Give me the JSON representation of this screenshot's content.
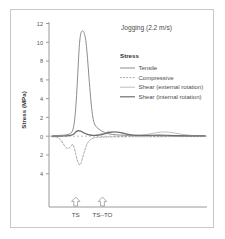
{
  "chart_data": {
    "type": "line",
    "title": "Jogging (2.2 m/s)",
    "xlabel": "",
    "ylabel": "Stress (MPa)",
    "ylim": [
      -4,
      12
    ],
    "y_ticks": [
      12,
      10,
      8,
      6,
      4,
      2,
      0,
      2,
      4
    ],
    "y_tick_values": [
      12,
      10,
      8,
      6,
      4,
      2,
      0,
      -2,
      -4
    ],
    "grid": false,
    "zero_line": true,
    "legend_position": "upper-right",
    "x_event_labels": [
      "TS",
      "TS–TO"
    ],
    "x_event_positions": [
      0.155,
      0.33
    ],
    "series": [
      {
        "name": "Tensile",
        "color": "#8c8c8c",
        "style": "solid",
        "width": 1.0,
        "points": [
          [
            0.0,
            0.05
          ],
          [
            0.04,
            0.08
          ],
          [
            0.08,
            0.12
          ],
          [
            0.105,
            0.2
          ],
          [
            0.125,
            0.35
          ],
          [
            0.14,
            0.9
          ],
          [
            0.152,
            2.4
          ],
          [
            0.163,
            5.0
          ],
          [
            0.172,
            7.8
          ],
          [
            0.18,
            9.9
          ],
          [
            0.188,
            10.9
          ],
          [
            0.196,
            11.2
          ],
          [
            0.205,
            11.15
          ],
          [
            0.214,
            10.8
          ],
          [
            0.223,
            9.9
          ],
          [
            0.232,
            8.3
          ],
          [
            0.242,
            6.2
          ],
          [
            0.252,
            4.2
          ],
          [
            0.262,
            2.6
          ],
          [
            0.272,
            1.6
          ],
          [
            0.285,
            1.1
          ],
          [
            0.3,
            0.85
          ],
          [
            0.32,
            0.6
          ],
          [
            0.345,
            0.4
          ],
          [
            0.375,
            0.25
          ],
          [
            0.42,
            0.15
          ],
          [
            0.48,
            0.1
          ],
          [
            0.56,
            0.08
          ],
          [
            0.66,
            0.06
          ],
          [
            0.78,
            0.05
          ],
          [
            0.9,
            0.04
          ],
          [
            1.0,
            0.04
          ]
        ]
      },
      {
        "name": "Compressive",
        "color": "#9a9a9a",
        "style": "dashed",
        "width": 0.9,
        "points": [
          [
            0.0,
            -0.05
          ],
          [
            0.03,
            -0.1
          ],
          [
            0.055,
            -0.35
          ],
          [
            0.075,
            -0.85
          ],
          [
            0.095,
            -1.25
          ],
          [
            0.112,
            -1.25
          ],
          [
            0.125,
            -1.0
          ],
          [
            0.136,
            -0.9
          ],
          [
            0.145,
            -1.2
          ],
          [
            0.155,
            -1.9
          ],
          [
            0.165,
            -2.55
          ],
          [
            0.175,
            -2.95
          ],
          [
            0.182,
            -3.05
          ],
          [
            0.19,
            -2.85
          ],
          [
            0.2,
            -2.3
          ],
          [
            0.212,
            -1.6
          ],
          [
            0.225,
            -1.0
          ],
          [
            0.24,
            -0.55
          ],
          [
            0.258,
            -0.28
          ],
          [
            0.28,
            -0.15
          ],
          [
            0.31,
            -0.1
          ],
          [
            0.35,
            -0.08
          ],
          [
            0.42,
            -0.06
          ],
          [
            0.5,
            -0.05
          ],
          [
            0.62,
            -0.05
          ],
          [
            0.78,
            -0.04
          ],
          [
            1.0,
            -0.04
          ]
        ]
      },
      {
        "name": "Shear (external rotation)",
        "color": "#b5b5b5",
        "style": "solid",
        "width": 0.9,
        "points": [
          [
            0.0,
            0.0
          ],
          [
            0.05,
            0.02
          ],
          [
            0.1,
            0.05
          ],
          [
            0.14,
            0.2
          ],
          [
            0.16,
            0.45
          ],
          [
            0.175,
            0.55
          ],
          [
            0.19,
            0.5
          ],
          [
            0.21,
            0.35
          ],
          [
            0.235,
            0.2
          ],
          [
            0.27,
            0.12
          ],
          [
            0.32,
            0.25
          ],
          [
            0.36,
            0.45
          ],
          [
            0.4,
            0.5
          ],
          [
            0.44,
            0.42
          ],
          [
            0.48,
            0.25
          ],
          [
            0.53,
            0.12
          ],
          [
            0.58,
            0.1
          ],
          [
            0.64,
            0.25
          ],
          [
            0.7,
            0.42
          ],
          [
            0.75,
            0.45
          ],
          [
            0.8,
            0.35
          ],
          [
            0.85,
            0.2
          ],
          [
            0.9,
            0.1
          ],
          [
            0.95,
            0.05
          ],
          [
            1.0,
            0.03
          ]
        ]
      },
      {
        "name": "Shear (internal rotation)",
        "color": "#6e6e6e",
        "style": "solid",
        "width": 1.2,
        "points": [
          [
            0.0,
            0.0
          ],
          [
            0.06,
            0.02
          ],
          [
            0.11,
            0.06
          ],
          [
            0.14,
            0.22
          ],
          [
            0.158,
            0.5
          ],
          [
            0.172,
            0.6
          ],
          [
            0.186,
            0.55
          ],
          [
            0.205,
            0.38
          ],
          [
            0.23,
            0.2
          ],
          [
            0.26,
            0.1
          ],
          [
            0.29,
            0.08
          ],
          [
            0.33,
            0.2
          ],
          [
            0.37,
            0.38
          ],
          [
            0.41,
            0.45
          ],
          [
            0.45,
            0.38
          ],
          [
            0.49,
            0.22
          ],
          [
            0.54,
            0.1
          ],
          [
            0.59,
            0.08
          ],
          [
            0.64,
            0.1
          ],
          [
            0.7,
            0.12
          ],
          [
            0.76,
            0.1
          ],
          [
            0.83,
            0.06
          ],
          [
            0.9,
            0.04
          ],
          [
            1.0,
            0.03
          ]
        ]
      }
    ]
  },
  "legend": {
    "title": "Stress",
    "entries": [
      {
        "label": "Tensile",
        "color": "#8c8c8c",
        "style": "solid"
      },
      {
        "label": "Compressive",
        "color": "#9a9a9a",
        "style": "dashed"
      },
      {
        "label": "Shear (external rotation)",
        "color": "#b5b5b5",
        "style": "solid"
      },
      {
        "label": "Shear (internal rotation)",
        "color": "#6e6e6e",
        "style": "solid"
      }
    ]
  },
  "axis": {
    "y_title": "Stress (MPa)",
    "tick_labels": [
      "12",
      "10",
      "8",
      "6",
      "4",
      "2",
      "0",
      "2",
      "4"
    ]
  },
  "events": {
    "first_label": "TS",
    "second_label": "TS–TO",
    "marker_icon": "up-arrow-icon"
  },
  "colors": {
    "frame": "#c8c8c8",
    "axis": "#9a9a9a",
    "text": "#4a4a4a",
    "zero_line": "#b0b0b0"
  }
}
